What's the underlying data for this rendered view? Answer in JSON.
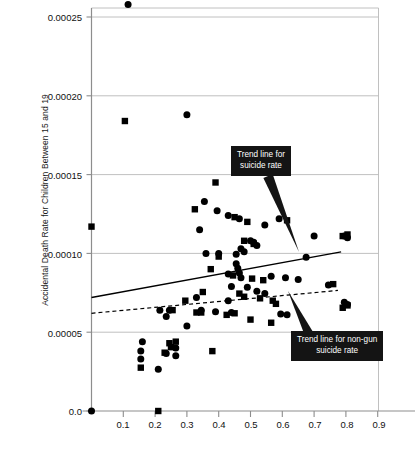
{
  "chart_data": {
    "type": "scatter",
    "title": "",
    "xlabel": "",
    "ylabel": "Accidental Death Rate for Children Between 15 and 19",
    "xlim": [
      0.0,
      0.95
    ],
    "ylim": [
      0.0,
      0.000265
    ],
    "grid": true,
    "legend": "none",
    "xticks": [
      "0.1",
      "0.2",
      "0.3",
      "0.4",
      "0.5",
      "0.6",
      "0.7",
      "0.8",
      "0.9"
    ],
    "xtick_values": [
      0.1,
      0.2,
      0.3,
      0.4,
      0.5,
      0.6,
      0.7,
      0.8,
      0.9
    ],
    "yticks": [
      "0.0",
      "0.00005",
      "0.00010",
      "0.00015",
      "0.00020",
      "0.00025"
    ],
    "ytick_values": [
      0.0,
      5e-05,
      0.0001,
      0.00015,
      0.0002,
      0.00025
    ],
    "series": [
      {
        "name": "suicide rate",
        "marker": "circle",
        "color": "#000000",
        "points": [
          [
            0.115,
            0.000258
          ],
          [
            0.3,
            0.000188
          ],
          [
            0.0,
            0.0
          ],
          [
            0.355,
            0.000133
          ],
          [
            0.395,
            0.000127
          ],
          [
            0.43,
            0.000124
          ],
          [
            0.465,
            0.000122
          ],
          [
            0.59,
            0.000122
          ],
          [
            0.34,
            0.000115
          ],
          [
            0.545,
            0.000118
          ],
          [
            0.7,
            0.000111
          ],
          [
            0.795,
            0.000111
          ],
          [
            0.805,
            0.00011
          ],
          [
            0.5,
            0.000108
          ],
          [
            0.51,
            0.000107
          ],
          [
            0.52,
            0.000105
          ],
          [
            0.36,
            0.0001
          ],
          [
            0.4,
            0.0001
          ],
          [
            0.455,
            9.95e-05
          ],
          [
            0.47,
            0.000103
          ],
          [
            0.48,
            0.000101
          ],
          [
            0.675,
            9.75e-05
          ],
          [
            0.455,
            9.35e-05
          ],
          [
            0.46,
            9.05e-05
          ],
          [
            0.465,
            8.75e-05
          ],
          [
            0.47,
            8.45e-05
          ],
          [
            0.43,
            8.7e-05
          ],
          [
            0.565,
            8.55e-05
          ],
          [
            0.61,
            8.45e-05
          ],
          [
            0.65,
            8.35e-05
          ],
          [
            0.745,
            8e-05
          ],
          [
            0.44,
            7.9e-05
          ],
          [
            0.49,
            7.85e-05
          ],
          [
            0.52,
            7.6e-05
          ],
          [
            0.545,
            7.45e-05
          ],
          [
            0.33,
            7.2e-05
          ],
          [
            0.43,
            7e-05
          ],
          [
            0.795,
            6.9e-05
          ],
          [
            0.805,
            6.75e-05
          ],
          [
            0.215,
            6.4e-05
          ],
          [
            0.245,
            6.4e-05
          ],
          [
            0.39,
            6.3e-05
          ],
          [
            0.44,
            6.25e-05
          ],
          [
            0.595,
            6.15e-05
          ],
          [
            0.615,
            6.1e-05
          ],
          [
            0.235,
            6e-05
          ],
          [
            0.3,
            5.4e-05
          ],
          [
            0.16,
            4.4e-05
          ],
          [
            0.155,
            3.8e-05
          ],
          [
            0.155,
            3.3e-05
          ],
          [
            0.235,
            3.65e-05
          ],
          [
            0.265,
            3.5e-05
          ],
          [
            0.265,
            4e-05
          ],
          [
            0.21,
            2.65e-05
          ],
          [
            0.345,
            6.4e-05
          ]
        ]
      },
      {
        "name": "non-gun suicide rate",
        "marker": "square",
        "color": "#000000",
        "points": [
          [
            0.0,
            0.000117
          ],
          [
            0.105,
            0.000184
          ],
          [
            0.39,
            0.000145
          ],
          [
            0.325,
            0.000128
          ],
          [
            0.45,
            0.000123
          ],
          [
            0.49,
            0.00012
          ],
          [
            0.615,
            0.000121
          ],
          [
            0.48,
            0.000108
          ],
          [
            0.51,
            0.000106
          ],
          [
            0.79,
            0.000111
          ],
          [
            0.805,
            0.000112
          ],
          [
            0.4,
            9.8e-05
          ],
          [
            0.375,
            9e-05
          ],
          [
            0.445,
            8.6e-05
          ],
          [
            0.505,
            8.4e-05
          ],
          [
            0.54,
            8.3e-05
          ],
          [
            0.76,
            8.05e-05
          ],
          [
            0.35,
            7.55e-05
          ],
          [
            0.465,
            7.45e-05
          ],
          [
            0.48,
            7.25e-05
          ],
          [
            0.53,
            7.15e-05
          ],
          [
            0.57,
            7e-05
          ],
          [
            0.58,
            6.8e-05
          ],
          [
            0.295,
            7e-05
          ],
          [
            0.805,
            6.7e-05
          ],
          [
            0.79,
            6.55e-05
          ],
          [
            0.255,
            6.4e-05
          ],
          [
            0.33,
            6.25e-05
          ],
          [
            0.45,
            6.2e-05
          ],
          [
            0.5,
            5.8e-05
          ],
          [
            0.565,
            5.6e-05
          ],
          [
            0.245,
            4.3e-05
          ],
          [
            0.25,
            4.05e-05
          ],
          [
            0.23,
            3.7e-05
          ],
          [
            0.265,
            4.4e-05
          ],
          [
            0.38,
            3.8e-05
          ],
          [
            0.155,
            2.75e-05
          ],
          [
            0.21,
            0.0
          ],
          [
            0.345,
            6.25e-05
          ],
          [
            0.425,
            6.1e-05
          ]
        ]
      }
    ],
    "trend_lines": [
      {
        "name": "suicide rate",
        "style": "solid",
        "x_start": 0.0,
        "y_start": 7.2e-05,
        "x_end": 0.785,
        "y_end": 0.000101
      },
      {
        "name": "non-gun suicide rate",
        "style": "dashed",
        "x_start": 0.0,
        "y_start": 6.2e-05,
        "x_end": 0.775,
        "y_end": 7.65e-05
      }
    ],
    "annotations": [
      {
        "id": "suicide",
        "lines": [
          "Trend line for",
          "suicide rate"
        ],
        "text": "Trend line for suicide rate",
        "points_to": [
          0.63,
          0.000105
        ]
      },
      {
        "id": "nongun",
        "lines": [
          "Trend line for non-gun",
          "suicide rate"
        ],
        "text": "Trend line for non-gun suicide rate",
        "points_to": [
          0.645,
          7.2e-05
        ]
      }
    ]
  }
}
